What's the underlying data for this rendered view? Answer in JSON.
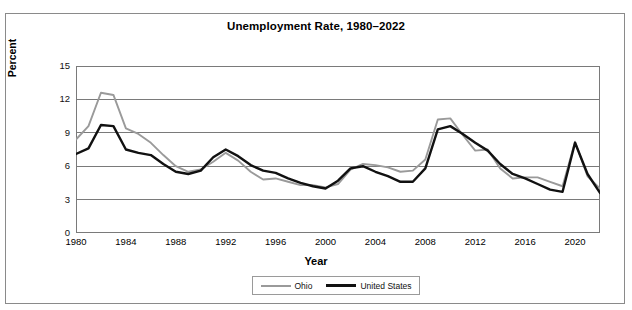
{
  "chart_data": {
    "type": "line",
    "title": "Unemployment Rate, 1980–2022",
    "xlabel": "Year",
    "ylabel": "Percent",
    "xlim": [
      1980,
      2022
    ],
    "ylim": [
      0,
      15
    ],
    "y_ticks": [
      0,
      3,
      6,
      9,
      12,
      15
    ],
    "x_tick_labels": [
      1980,
      1984,
      1988,
      1992,
      1996,
      2000,
      2004,
      2008,
      2012,
      2016,
      2020
    ],
    "x_minor_tick_step": 1,
    "grid": "horizontal",
    "legend_position": "bottom",
    "x": [
      1980,
      1981,
      1982,
      1983,
      1984,
      1985,
      1986,
      1987,
      1988,
      1989,
      1990,
      1991,
      1992,
      1993,
      1994,
      1995,
      1996,
      1997,
      1998,
      1999,
      2000,
      2001,
      2002,
      2003,
      2004,
      2005,
      2006,
      2007,
      2008,
      2009,
      2010,
      2011,
      2012,
      2013,
      2014,
      2015,
      2016,
      2017,
      2018,
      2019,
      2020,
      2021,
      2022
    ],
    "series": [
      {
        "name": "Ohio",
        "color": "#9a9a9a",
        "values": [
          8.4,
          9.6,
          12.6,
          12.4,
          9.4,
          8.9,
          8.1,
          7.0,
          6.0,
          5.5,
          5.7,
          6.4,
          7.2,
          6.5,
          5.5,
          4.8,
          4.9,
          4.6,
          4.3,
          4.3,
          4.1,
          4.4,
          5.7,
          6.2,
          6.1,
          5.9,
          5.5,
          5.6,
          6.6,
          10.2,
          10.3,
          8.8,
          7.4,
          7.5,
          5.8,
          4.9,
          5.0,
          5.0,
          4.6,
          4.2,
          8.2,
          5.1,
          4.0
        ]
      },
      {
        "name": "United States",
        "color": "#111111",
        "values": [
          7.1,
          7.6,
          9.7,
          9.6,
          7.5,
          7.2,
          7.0,
          6.2,
          5.5,
          5.3,
          5.6,
          6.8,
          7.5,
          6.9,
          6.1,
          5.6,
          5.4,
          4.9,
          4.5,
          4.2,
          4.0,
          4.7,
          5.8,
          6.0,
          5.5,
          5.1,
          4.6,
          4.6,
          5.8,
          9.3,
          9.6,
          8.9,
          8.1,
          7.4,
          6.2,
          5.3,
          4.9,
          4.4,
          3.9,
          3.7,
          8.1,
          5.3,
          3.6
        ]
      }
    ]
  },
  "legend": {
    "items": [
      {
        "label": "Ohio",
        "style": "ohio"
      },
      {
        "label": "United States",
        "style": "us"
      }
    ]
  }
}
